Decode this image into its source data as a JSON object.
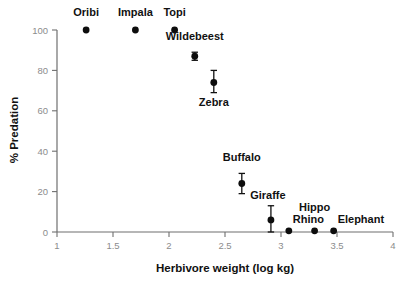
{
  "chart_data": {
    "type": "scatter",
    "title": "",
    "xlabel": "Herbivore weight (log kg)",
    "ylabel": "% Predation",
    "xlim": [
      1,
      4
    ],
    "ylim": [
      0,
      100
    ],
    "xticks": [
      "1",
      "1.5",
      "2",
      "2.5",
      "3",
      "3.5",
      "4"
    ],
    "xtick_values": [
      1,
      1.5,
      2,
      2.5,
      3,
      3.5,
      4
    ],
    "yticks": [
      "0",
      "20",
      "40",
      "60",
      "80",
      "100"
    ],
    "ytick_values": [
      0,
      20,
      40,
      60,
      80,
      100
    ],
    "grid": false,
    "legend": "none",
    "marker": "filled-circle",
    "marker_color": "#0d0d0d",
    "errorbar_color": "#111111",
    "axis_color": "#6f6f6f",
    "tick_label_color": "#8c8c8c",
    "points": [
      {
        "label": "Oribi",
        "x": 1.26,
        "y": 100,
        "yerr_low": 100,
        "yerr_high": 100,
        "label_dx": 0,
        "label_dy": -14,
        "anchor": "middle"
      },
      {
        "label": "Impala",
        "x": 1.7,
        "y": 100,
        "yerr_low": 100,
        "yerr_high": 100,
        "label_dx": 0,
        "label_dy": -14,
        "anchor": "middle"
      },
      {
        "label": "Topi",
        "x": 2.05,
        "y": 100,
        "yerr_low": 100,
        "yerr_high": 100,
        "label_dx": 0,
        "label_dy": -14,
        "anchor": "middle"
      },
      {
        "label": "Wildebeest",
        "x": 2.23,
        "y": 87,
        "yerr_low": 85,
        "yerr_high": 89,
        "label_dx": 0,
        "label_dy": -16,
        "anchor": "middle"
      },
      {
        "label": "Zebra",
        "x": 2.4,
        "y": 74,
        "yerr_low": 69,
        "yerr_high": 80,
        "label_dx": 0,
        "label_dy": 23,
        "anchor": "middle"
      },
      {
        "label": "Buffalo",
        "x": 2.65,
        "y": 24,
        "yerr_low": 19,
        "yerr_high": 29,
        "label_dx": 0,
        "label_dy": -23,
        "anchor": "middle"
      },
      {
        "label": "Giraffe",
        "x": 2.91,
        "y": 6,
        "yerr_low": 0,
        "yerr_high": 13,
        "label_dx": -3,
        "label_dy": -21,
        "anchor": "middle"
      },
      {
        "label": "Rhino",
        "x": 3.07,
        "y": 0.6,
        "yerr_low": 0.6,
        "yerr_high": 0.6,
        "label_dx": 4,
        "label_dy": -8,
        "anchor": "start"
      },
      {
        "label": "Hippo",
        "x": 3.3,
        "y": 0.6,
        "yerr_low": 0.6,
        "yerr_high": 0.6,
        "label_dx": 0,
        "label_dy": -20,
        "anchor": "middle"
      },
      {
        "label": "Elephant",
        "x": 3.47,
        "y": 0.6,
        "yerr_low": 0.6,
        "yerr_high": 0.6,
        "label_dx": 4,
        "label_dy": -8,
        "anchor": "start"
      }
    ]
  }
}
